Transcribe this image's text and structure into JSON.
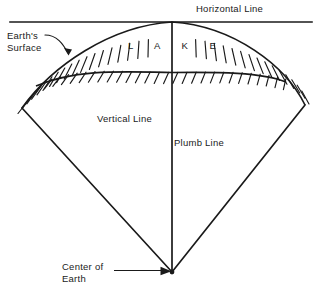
{
  "figure": {
    "title_visible": false,
    "background_color": "#ffffff",
    "ink_color": "#1a1a1a",
    "width": 322,
    "height": 296
  },
  "labels": {
    "horizontal_line": "Horizontal Line",
    "earths_surface_line1": "Earth's",
    "earths_surface_line2": "Surface",
    "lake": "L A K E",
    "vertical_line": "Vertical Line",
    "plumb_line": "Plumb Line",
    "center_of_earth_line1": "Center of",
    "center_of_earth_line2": "Earth"
  },
  "geometry": {
    "horizontal_line": {
      "x1": 10,
      "y1": 22,
      "x2": 312,
      "y2": 22
    },
    "apex_top": {
      "x": 172,
      "y": 22
    },
    "center_of_earth": {
      "x": 172,
      "y": 272
    },
    "left_vertex": {
      "x": 22,
      "y": 108
    },
    "right_vertex": {
      "x": 305,
      "y": 105
    },
    "lake_bottom_center": {
      "x": 172,
      "y": 72
    },
    "earth_surface_arc": "convex-up arc tangent to horizontal line at apex",
    "lake_bed_curve": "concave-up sagging curve between vertices",
    "hatching": "short tick marks below earth surface arc and below lake bed"
  },
  "icon_names": {
    "leader_curve": "leader-line-icon",
    "leader_arrow": "leader-arrow-icon",
    "hatch": "hatch-marks-icon"
  }
}
